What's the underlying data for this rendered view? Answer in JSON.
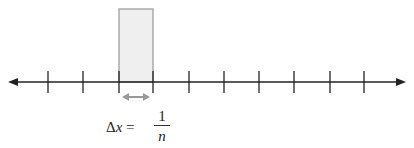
{
  "diagram": {
    "number_line": {
      "y": 82,
      "x_start": 8,
      "x_end": 406,
      "arrows": [
        "left",
        "right"
      ],
      "tick_positions": [
        48,
        83,
        119,
        153,
        189,
        224,
        259,
        294,
        330,
        364
      ],
      "tick_top": 71,
      "tick_bottom": 93,
      "color": "#222222"
    },
    "rectangle": {
      "x": 119,
      "y": 9,
      "width": 34,
      "height": 73,
      "fill": "#efefef",
      "stroke": "#aaaaaa"
    },
    "width_arrow": {
      "x1": 122,
      "x2": 150,
      "y": 97,
      "color": "#999999"
    },
    "formula": {
      "lhs_delta": "Δ",
      "lhs_var": "x",
      "equals": " = ",
      "numerator": "1",
      "denominator": "n"
    }
  }
}
